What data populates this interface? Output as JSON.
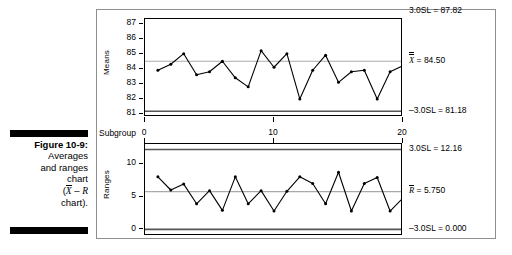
{
  "caption": {
    "figure_number": "Figure 10-9:",
    "line1": "Averages",
    "line2": "and ranges",
    "line3": "chart",
    "line4_prefix": "(",
    "line4_xbar": "X",
    "line4_dash": " – ",
    "line4_r": "R",
    "line5": "chart)."
  },
  "chart_data": [
    {
      "type": "line",
      "title": "Means control chart",
      "xlabel": "Subgroup",
      "ylabel": "Means",
      "x": [
        1,
        2,
        3,
        4,
        5,
        6,
        7,
        8,
        9,
        10,
        11,
        12,
        13,
        14,
        15,
        16,
        17,
        18,
        19,
        20
      ],
      "values": [
        83.9,
        84.3,
        85.0,
        83.6,
        83.8,
        84.5,
        83.4,
        82.8,
        85.2,
        84.1,
        85.0,
        82.0,
        83.9,
        84.9,
        83.1,
        83.8,
        83.9,
        82.0,
        83.8,
        84.2
      ],
      "xlim": [
        0,
        20
      ],
      "ylim": [
        80.8,
        87.3
      ],
      "xticks": [
        0,
        10,
        20
      ],
      "xticklabels": [
        "0",
        "10",
        "20"
      ],
      "yticks": [
        81,
        82,
        83,
        84,
        85,
        86,
        87
      ],
      "yticklabels": [
        "81",
        "82",
        "83",
        "84",
        "85",
        "86",
        "87"
      ],
      "grid": false,
      "center_line": {
        "value": 84.5,
        "label": "X̅ = 84.50",
        "label_value": "84.50",
        "symbol": "X"
      },
      "upper_limit": {
        "value": 87.82,
        "label": "3.0SL = 87.82"
      },
      "lower_limit": {
        "value": 81.18,
        "label": "-3.0SL = 81.18"
      },
      "legend_position": "right-outside",
      "marker": "filled-circle",
      "line_color": "#000000"
    },
    {
      "type": "line",
      "title": "Ranges control chart",
      "xlabel": "Subgroup",
      "ylabel": "Ranges",
      "x": [
        1,
        2,
        3,
        4,
        5,
        6,
        7,
        8,
        9,
        10,
        11,
        12,
        13,
        14,
        15,
        16,
        17,
        18,
        19,
        20
      ],
      "values": [
        8.0,
        6.0,
        6.9,
        3.9,
        5.9,
        2.9,
        8.0,
        3.9,
        5.9,
        2.8,
        5.8,
        8.0,
        7.0,
        3.9,
        8.7,
        2.8,
        7.0,
        7.9,
        2.8,
        4.8
      ],
      "xlim": [
        0,
        20
      ],
      "ylim": [
        -1.0,
        13.0
      ],
      "xticks": [
        0,
        10,
        20
      ],
      "xticklabels": [
        "0",
        "10",
        "20"
      ],
      "yticks": [
        0,
        5,
        10
      ],
      "yticklabels": [
        "0",
        "5",
        "10"
      ],
      "grid": false,
      "center_line": {
        "value": 5.75,
        "label": "R̅ = 5.750",
        "label_value": "5.750",
        "symbol": "R"
      },
      "upper_limit": {
        "value": 12.16,
        "label": "3.0SL = 12.16"
      },
      "lower_limit": {
        "value": 0.0,
        "label": "-3.0SL = 0.000"
      },
      "legend_position": "right-outside",
      "marker": "filled-circle",
      "line_color": "#000000"
    }
  ],
  "annotations": {
    "means_ucl": "3.0SL = 87.82",
    "means_cl_value": "= 84.50",
    "means_lcl": "–3.0SL = 81.18",
    "ranges_ucl": "3.0SL = 12.16",
    "ranges_cl_value": "= 5.750",
    "ranges_lcl": "–3.0SL = 0.000",
    "xaxis_name": "Subgroup",
    "means_yaxis_name": "Means",
    "ranges_yaxis_name": "Ranges"
  },
  "colors": {
    "limit_line": "#555555",
    "center_line": "#aaaaaa",
    "data_line": "#000000",
    "frame": "#8e8e8e"
  }
}
